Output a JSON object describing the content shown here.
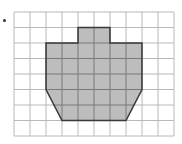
{
  "figure": {
    "grid": {
      "columns": 10,
      "rows": 8,
      "origin_px": [
        14,
        12
      ],
      "cell_w": 16,
      "cell_h": 15.5,
      "line_color": "#b8b8b8"
    },
    "shape": {
      "fill": "#bdbdbd",
      "stroke": "#3a3a3a",
      "vertices_grid": [
        [
          4,
          1
        ],
        [
          6,
          1
        ],
        [
          6,
          2
        ],
        [
          8,
          2
        ],
        [
          8,
          5
        ],
        [
          7,
          7
        ],
        [
          3,
          7
        ],
        [
          2,
          5
        ],
        [
          2,
          2
        ],
        [
          4,
          2
        ]
      ]
    },
    "bullet_color": "#333333"
  }
}
